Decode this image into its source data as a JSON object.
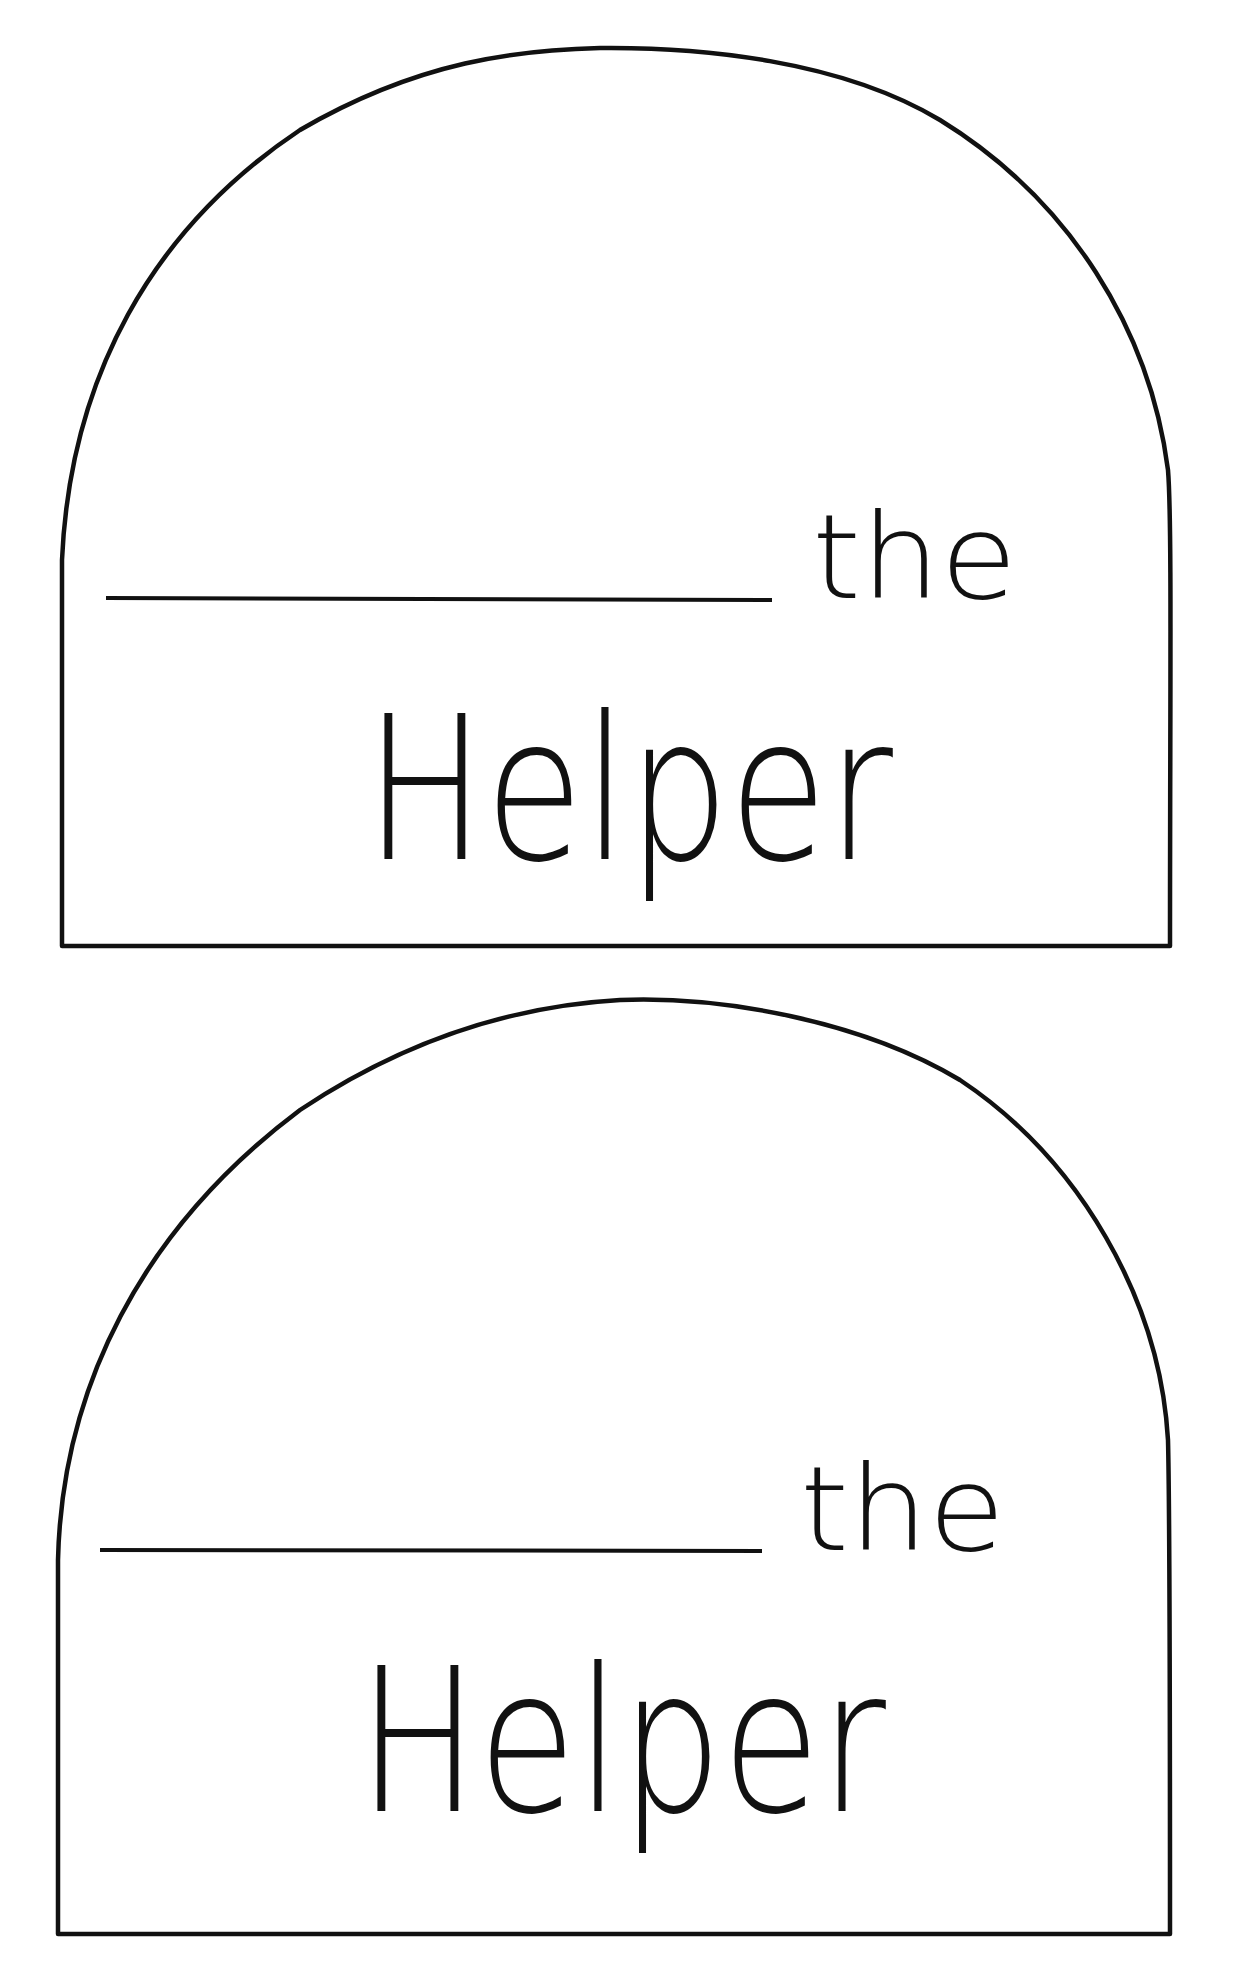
{
  "document": {
    "cards": [
      {
        "blank_line": "",
        "word_the": "the",
        "word_helper": "Helper"
      },
      {
        "blank_line": "",
        "word_the": "the",
        "word_helper": "Helper"
      }
    ],
    "colors": {
      "ink": "#111111",
      "paper": "#ffffff"
    }
  }
}
